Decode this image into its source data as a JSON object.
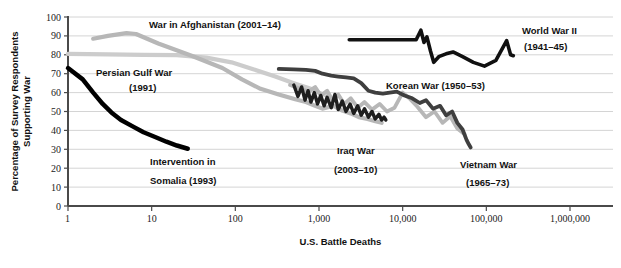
{
  "chart_data": {
    "type": "line",
    "title": "",
    "xlabel": "U.S. Battle Deaths",
    "ylabel_line1": "Percentage of Survey Respondents",
    "ylabel_line2": "Supporting War",
    "xscale": "log",
    "xlim": [
      1,
      1000000
    ],
    "ylim": [
      0,
      100
    ],
    "grid": true,
    "legend_position": "inline-annotations",
    "xticks": [
      1,
      10,
      100,
      1000,
      10000,
      100000,
      1000000
    ],
    "xtick_labels": [
      "1",
      "10",
      "100",
      "1,000",
      "10,000",
      "100,000",
      "1,000,000"
    ],
    "yticks": [
      0,
      10,
      20,
      30,
      40,
      50,
      60,
      70,
      80,
      90,
      100
    ],
    "ytick_labels": [
      "0",
      "10",
      "20",
      "30",
      "40",
      "50",
      "60",
      "70",
      "80",
      "90",
      "100"
    ],
    "series": [
      {
        "name": "War in Afghanistan (2001-14)",
        "color": "#b7b7b7",
        "width": 4.2,
        "points": [
          [
            2.0,
            88.5
          ],
          [
            3.0,
            90.0
          ],
          [
            5.0,
            91.5
          ],
          [
            6.5,
            91.0
          ],
          [
            12,
            86.0
          ],
          [
            30,
            79.5
          ],
          [
            70,
            73.0
          ],
          [
            120,
            67.0
          ],
          [
            200,
            62.0
          ],
          [
            330,
            59.0
          ],
          [
            520,
            56.5
          ],
          [
            700,
            55.0
          ],
          [
            900,
            53.0
          ],
          [
            1100,
            51.5
          ],
          [
            1500,
            53.0
          ],
          [
            1900,
            50.5
          ],
          [
            2400,
            49.0
          ],
          [
            3000,
            47.0
          ],
          [
            3800,
            46.0
          ],
          [
            4600,
            45.0
          ],
          [
            5600,
            44.0
          ]
        ]
      },
      {
        "name": "Persian Gulf War (1991)",
        "color": "#cccccc",
        "width": 4.2,
        "points": [
          [
            1.0,
            80.5
          ],
          [
            3,
            80.2
          ],
          [
            8,
            80.0
          ],
          [
            20,
            79.8
          ],
          [
            45,
            78.5
          ],
          [
            90,
            76.0
          ],
          [
            160,
            72.5
          ],
          [
            300,
            68.5
          ],
          [
            500,
            65.0
          ],
          [
            800,
            62.0
          ],
          [
            1000,
            60.0
          ],
          [
            1300,
            58.0
          ]
        ]
      },
      {
        "name": "Intervention in Somalia (1993)",
        "color": "#000000",
        "width": 4.5,
        "points": [
          [
            1.0,
            73.0
          ],
          [
            1.5,
            67.0
          ],
          [
            2.0,
            60.0
          ],
          [
            2.6,
            54.0
          ],
          [
            3.3,
            49.5
          ],
          [
            4.3,
            45.5
          ],
          [
            6,
            42.0
          ],
          [
            8,
            39.0
          ],
          [
            11,
            36.5
          ],
          [
            15,
            34.0
          ],
          [
            20,
            32.0
          ],
          [
            27,
            30.3
          ]
        ]
      },
      {
        "name": "World War II (1941-45)",
        "color": "#111111",
        "width": 3.6,
        "points": [
          [
            2300,
            88.0
          ],
          [
            3200,
            88.0
          ],
          [
            4500,
            88.0
          ],
          [
            6400,
            88.0
          ],
          [
            9000,
            88.0
          ],
          [
            12000,
            88.0
          ],
          [
            14500,
            88.0
          ],
          [
            16500,
            93.0
          ],
          [
            18000,
            86.5
          ],
          [
            19500,
            89.5
          ],
          [
            21500,
            82.0
          ],
          [
            23500,
            76.0
          ],
          [
            27000,
            79.0
          ],
          [
            33000,
            80.5
          ],
          [
            40000,
            81.5
          ],
          [
            52000,
            79.0
          ],
          [
            70000,
            76.0
          ],
          [
            95000,
            74.0
          ],
          [
            130000,
            77.0
          ],
          [
            175000,
            87.5
          ],
          [
            195000,
            80.0
          ],
          [
            210000,
            79.5
          ]
        ]
      },
      {
        "name": "Korean War (1950-53)",
        "color": "#b7b7b7",
        "width": 3.8,
        "points": [
          [
            450,
            64.0
          ],
          [
            600,
            62.0
          ],
          [
            750,
            60.5
          ],
          [
            900,
            63.0
          ],
          [
            1050,
            58.5
          ],
          [
            1250,
            61.0
          ],
          [
            1450,
            56.0
          ],
          [
            1700,
            59.0
          ],
          [
            2000,
            54.0
          ],
          [
            2400,
            57.0
          ],
          [
            2900,
            52.0
          ],
          [
            3500,
            55.0
          ],
          [
            4300,
            51.0
          ],
          [
            5300,
            54.0
          ],
          [
            6500,
            50.0
          ],
          [
            8000,
            52.0
          ],
          [
            10000,
            60.0
          ],
          [
            12000,
            57.0
          ],
          [
            15000,
            52.5
          ],
          [
            19000,
            47.0
          ],
          [
            24000,
            50.0
          ],
          [
            30000,
            44.0
          ],
          [
            37000,
            47.5
          ],
          [
            45000,
            41.0
          ],
          [
            55000,
            38.0
          ]
        ]
      },
      {
        "name": "Vietnam War (1965-73)",
        "color": "#3f3f3f",
        "width": 3.8,
        "points": [
          [
            330,
            72.5
          ],
          [
            500,
            72.3
          ],
          [
            700,
            72.0
          ],
          [
            900,
            71.5
          ],
          [
            1100,
            70.0
          ],
          [
            1400,
            69.0
          ],
          [
            1700,
            68.5
          ],
          [
            2100,
            68.0
          ],
          [
            2600,
            67.5
          ],
          [
            3200,
            65.0
          ],
          [
            3900,
            61.0
          ],
          [
            4700,
            60.0
          ],
          [
            5800,
            59.5
          ],
          [
            7000,
            60.0
          ],
          [
            8500,
            60.5
          ],
          [
            10500,
            58.5
          ],
          [
            13000,
            57.0
          ],
          [
            16000,
            54.5
          ],
          [
            19000,
            56.0
          ],
          [
            23000,
            51.5
          ],
          [
            28000,
            53.0
          ],
          [
            33000,
            48.0
          ],
          [
            39000,
            50.0
          ],
          [
            45000,
            44.0
          ],
          [
            52000,
            40.5
          ],
          [
            58000,
            35.0
          ],
          [
            62000,
            32.5
          ],
          [
            65000,
            31.0
          ]
        ]
      },
      {
        "name": "Iraq War (2003-10)",
        "color": "#1e1e1e",
        "width": 3.4,
        "points": [
          [
            500,
            64.0
          ],
          [
            560,
            58.0
          ],
          [
            620,
            63.0
          ],
          [
            680,
            56.0
          ],
          [
            740,
            61.0
          ],
          [
            800,
            55.0
          ],
          [
            880,
            60.0
          ],
          [
            960,
            54.0
          ],
          [
            1050,
            58.5
          ],
          [
            1150,
            53.0
          ],
          [
            1250,
            57.5
          ],
          [
            1400,
            52.0
          ],
          [
            1550,
            59.0
          ],
          [
            1700,
            51.0
          ],
          [
            1900,
            55.5
          ],
          [
            2100,
            50.0
          ],
          [
            2350,
            54.0
          ],
          [
            2600,
            49.0
          ],
          [
            2900,
            53.0
          ],
          [
            3200,
            48.0
          ],
          [
            3500,
            51.5
          ],
          [
            3900,
            47.0
          ],
          [
            4300,
            50.0
          ],
          [
            4700,
            46.0
          ],
          [
            5200,
            48.5
          ],
          [
            5600,
            45.5
          ],
          [
            6000,
            47.0
          ],
          [
            6300,
            45.5
          ]
        ]
      }
    ],
    "annotations": [
      {
        "text": "War in Afghanistan (2001–14)",
        "x": 149,
        "y": 28,
        "anchor": "start"
      },
      {
        "text": "Persian Gulf War",
        "x": 96,
        "y": 76,
        "anchor": "start"
      },
      {
        "text": "(1991)",
        "x": 129,
        "y": 91,
        "anchor": "start"
      },
      {
        "text": "Intervention in",
        "x": 150,
        "y": 165,
        "anchor": "start"
      },
      {
        "text": "Somalia (1993)",
        "x": 150,
        "y": 184,
        "anchor": "start"
      },
      {
        "text": "Korean War (1950–53)",
        "x": 386,
        "y": 89,
        "anchor": "start"
      },
      {
        "text": "Iraq War",
        "x": 337,
        "y": 154,
        "anchor": "start"
      },
      {
        "text": "(2003–10)",
        "x": 334,
        "y": 173,
        "anchor": "start"
      },
      {
        "text": "Vietnam War",
        "x": 460,
        "y": 168,
        "anchor": "start"
      },
      {
        "text": "(1965–73)",
        "x": 466,
        "y": 186,
        "anchor": "start"
      },
      {
        "text": "World War II",
        "x": 522,
        "y": 34,
        "anchor": "start"
      },
      {
        "text": "(1941–45)",
        "x": 524,
        "y": 50,
        "anchor": "start"
      }
    ]
  },
  "colors": {
    "grid": "#c9c9c9",
    "axis": "#4a4a4a",
    "background": "#ffffff",
    "text": "#111111"
  }
}
